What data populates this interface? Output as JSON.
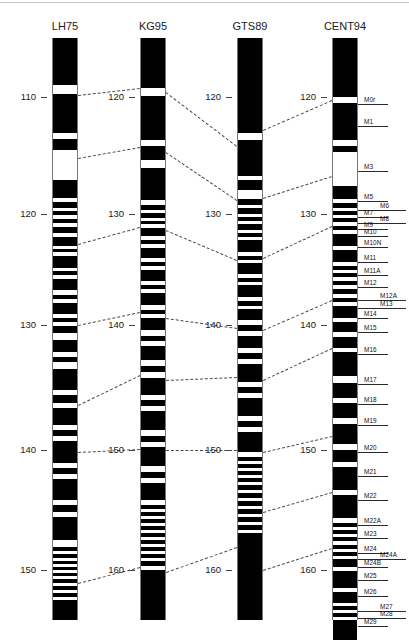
{
  "figure": {
    "type": "chromosome-ideogram-comparison",
    "columns": [
      {
        "id": "LH75",
        "title": "LH75",
        "x": 52,
        "width": 26,
        "top": 38,
        "bottom": 620,
        "axis": {
          "ticks": [
            110,
            120,
            130,
            140,
            150
          ],
          "tick_y": [
            97,
            214,
            325,
            450,
            570
          ]
        }
      },
      {
        "id": "KG95",
        "title": "KG95",
        "x": 140,
        "width": 26,
        "top": 38,
        "bottom": 620,
        "axis": {
          "ticks": [
            120,
            130,
            140,
            150,
            160
          ],
          "tick_y": [
            97,
            214,
            325,
            450,
            570
          ]
        }
      },
      {
        "id": "GTS89",
        "title": "GTS89",
        "x": 237,
        "width": 26,
        "top": 38,
        "bottom": 620,
        "axis": {
          "ticks": [
            120,
            130,
            140,
            150,
            160
          ],
          "tick_y": [
            97,
            214,
            325,
            450,
            570
          ]
        }
      },
      {
        "id": "CENT94",
        "title": "CENT94",
        "x": 332,
        "width": 26,
        "top": 38,
        "bottom": 620,
        "axis": {
          "ticks": [
            120,
            130,
            140,
            150,
            160
          ],
          "tick_y": [
            97,
            214,
            325,
            450,
            570
          ]
        }
      }
    ],
    "markers": [
      {
        "label": "M0r",
        "y": 100,
        "offset": false
      },
      {
        "label": "M1",
        "y": 122,
        "offset": false
      },
      {
        "label": "M3",
        "y": 167,
        "offset": false
      },
      {
        "label": "M5",
        "y": 197,
        "offset": false
      },
      {
        "label": "M6",
        "y": 206,
        "offset": true
      },
      {
        "label": "M7",
        "y": 213,
        "offset": false
      },
      {
        "label": "M8",
        "y": 219,
        "offset": true
      },
      {
        "label": "M9",
        "y": 225,
        "offset": false
      },
      {
        "label": "M10",
        "y": 232,
        "offset": false
      },
      {
        "label": "M10N",
        "y": 243,
        "offset": false
      },
      {
        "label": "M11",
        "y": 258,
        "offset": false
      },
      {
        "label": "M11A",
        "y": 271,
        "offset": false
      },
      {
        "label": "M12",
        "y": 283,
        "offset": false
      },
      {
        "label": "M12A",
        "y": 296,
        "offset": true
      },
      {
        "label": "M13",
        "y": 304,
        "offset": true
      },
      {
        "label": "M14",
        "y": 314,
        "offset": false
      },
      {
        "label": "M15",
        "y": 328,
        "offset": false
      },
      {
        "label": "M16",
        "y": 350,
        "offset": false
      },
      {
        "label": "M17",
        "y": 380,
        "offset": false
      },
      {
        "label": "M18",
        "y": 400,
        "offset": false
      },
      {
        "label": "M19",
        "y": 421,
        "offset": false
      },
      {
        "label": "M20",
        "y": 448,
        "offset": false
      },
      {
        "label": "M21",
        "y": 472,
        "offset": false
      },
      {
        "label": "M22",
        "y": 496,
        "offset": false
      },
      {
        "label": "M22A",
        "y": 521,
        "offset": false
      },
      {
        "label": "M23",
        "y": 534,
        "offset": false
      },
      {
        "label": "M24",
        "y": 549,
        "offset": false
      },
      {
        "label": "M24A",
        "y": 555,
        "offset": true
      },
      {
        "label": "M24B",
        "y": 563,
        "offset": false
      },
      {
        "label": "M25",
        "y": 576,
        "offset": false
      },
      {
        "label": "M26",
        "y": 592,
        "offset": false
      },
      {
        "label": "M27",
        "y": 607,
        "offset": true
      },
      {
        "label": "M28",
        "y": 614,
        "offset": true
      },
      {
        "label": "M29",
        "y": 622,
        "offset": false
      }
    ],
    "bands": {
      "LH75": [
        [
          38,
          85
        ],
        [
          94,
          133
        ],
        [
          139,
          150
        ],
        [
          180,
          198
        ],
        [
          202,
          208
        ],
        [
          211,
          215
        ],
        [
          219,
          223
        ],
        [
          227,
          233
        ],
        [
          237,
          246
        ],
        [
          249,
          252
        ],
        [
          256,
          268
        ],
        [
          271,
          275
        ],
        [
          279,
          290
        ],
        [
          295,
          299
        ],
        [
          303,
          314
        ],
        [
          318,
          322
        ],
        [
          326,
          333
        ],
        [
          340,
          352
        ],
        [
          357,
          362
        ],
        [
          369,
          390
        ],
        [
          395,
          403
        ],
        [
          408,
          425
        ],
        [
          430,
          436
        ],
        [
          441,
          463
        ],
        [
          468,
          474
        ],
        [
          479,
          500
        ],
        [
          505,
          512
        ],
        [
          517,
          540
        ],
        [
          547,
          551
        ],
        [
          554,
          558
        ],
        [
          561,
          564
        ],
        [
          567,
          570
        ],
        [
          573,
          576
        ],
        [
          579,
          583
        ],
        [
          586,
          590
        ],
        [
          593,
          597
        ],
        [
          600,
          620
        ]
      ],
      "KG95": [
        [
          38,
          88
        ],
        [
          96,
          140
        ],
        [
          146,
          160
        ],
        [
          168,
          200
        ],
        [
          205,
          210
        ],
        [
          213,
          218
        ],
        [
          221,
          224
        ],
        [
          228,
          236
        ],
        [
          240,
          244
        ],
        [
          248,
          258
        ],
        [
          262,
          266
        ],
        [
          270,
          281
        ],
        [
          285,
          289
        ],
        [
          293,
          305
        ],
        [
          310,
          314
        ],
        [
          318,
          330
        ],
        [
          336,
          341
        ],
        [
          346,
          360
        ],
        [
          366,
          372
        ],
        [
          378,
          395
        ],
        [
          400,
          406
        ],
        [
          411,
          430
        ],
        [
          436,
          442
        ],
        [
          447,
          466
        ],
        [
          472,
          478
        ],
        [
          483,
          500
        ],
        [
          505,
          509
        ],
        [
          512,
          516
        ],
        [
          519,
          523
        ],
        [
          526,
          530
        ],
        [
          533,
          537
        ],
        [
          540,
          544
        ],
        [
          547,
          551
        ],
        [
          554,
          558
        ],
        [
          561,
          566
        ],
        [
          570,
          620
        ]
      ],
      "GTS89": [
        [
          38,
          133
        ],
        [
          140,
          176
        ],
        [
          180,
          190
        ],
        [
          199,
          205
        ],
        [
          208,
          214
        ],
        [
          217,
          221
        ],
        [
          224,
          230
        ],
        [
          233,
          237
        ],
        [
          240,
          252
        ],
        [
          256,
          260
        ],
        [
          263,
          274
        ],
        [
          278,
          282
        ],
        [
          285,
          297
        ],
        [
          301,
          306
        ],
        [
          309,
          320
        ],
        [
          325,
          331
        ],
        [
          336,
          348
        ],
        [
          353,
          359
        ],
        [
          364,
          382
        ],
        [
          387,
          393
        ],
        [
          398,
          416
        ],
        [
          421,
          427
        ],
        [
          432,
          452
        ],
        [
          457,
          461
        ],
        [
          464,
          468
        ],
        [
          471,
          475
        ],
        [
          478,
          482
        ],
        [
          485,
          490
        ],
        [
          493,
          498
        ],
        [
          501,
          506
        ],
        [
          509,
          514
        ],
        [
          517,
          522
        ],
        [
          525,
          530
        ],
        [
          533,
          620
        ]
      ],
      "CENT94": [
        [
          38,
          97
        ],
        [
          103,
          140
        ],
        [
          146,
          152
        ],
        [
          186,
          199
        ],
        [
          203,
          208
        ],
        [
          211,
          215
        ],
        [
          218,
          222
        ],
        [
          226,
          230
        ],
        [
          234,
          246
        ],
        [
          250,
          262
        ],
        [
          266,
          270
        ],
        [
          273,
          277
        ],
        [
          281,
          285
        ],
        [
          289,
          294
        ],
        [
          298,
          302
        ],
        [
          306,
          318
        ],
        [
          322,
          332
        ],
        [
          337,
          348
        ],
        [
          352,
          376
        ],
        [
          383,
          398
        ],
        [
          403,
          418
        ],
        [
          424,
          444
        ],
        [
          450,
          462
        ],
        [
          467,
          490
        ],
        [
          495,
          518
        ],
        [
          523,
          527
        ],
        [
          530,
          534
        ],
        [
          537,
          541
        ],
        [
          545,
          549
        ],
        [
          552,
          556
        ],
        [
          559,
          567
        ],
        [
          571,
          588
        ],
        [
          592,
          603
        ],
        [
          606,
          610
        ],
        [
          613,
          617
        ],
        [
          620,
          640
        ]
      ]
    },
    "links": [
      {
        "x1": 78,
        "y1": 95,
        "x2": 140,
        "y2": 88
      },
      {
        "x1": 78,
        "y1": 158,
        "x2": 140,
        "y2": 147
      },
      {
        "x1": 78,
        "y1": 244,
        "x2": 140,
        "y2": 227
      },
      {
        "x1": 78,
        "y1": 325,
        "x2": 140,
        "y2": 312
      },
      {
        "x1": 78,
        "y1": 405,
        "x2": 140,
        "y2": 375
      },
      {
        "x1": 78,
        "y1": 452,
        "x2": 140,
        "y2": 449
      },
      {
        "x1": 78,
        "y1": 583,
        "x2": 140,
        "y2": 567
      },
      {
        "x1": 166,
        "y1": 92,
        "x2": 237,
        "y2": 146
      },
      {
        "x1": 166,
        "y1": 152,
        "x2": 237,
        "y2": 200
      },
      {
        "x1": 166,
        "y1": 230,
        "x2": 237,
        "y2": 260
      },
      {
        "x1": 166,
        "y1": 318,
        "x2": 237,
        "y2": 328
      },
      {
        "x1": 166,
        "y1": 380,
        "x2": 237,
        "y2": 377
      },
      {
        "x1": 166,
        "y1": 450,
        "x2": 237,
        "y2": 450
      },
      {
        "x1": 166,
        "y1": 572,
        "x2": 237,
        "y2": 547
      },
      {
        "x1": 263,
        "y1": 130,
        "x2": 332,
        "y2": 100
      },
      {
        "x1": 263,
        "y1": 198,
        "x2": 332,
        "y2": 176
      },
      {
        "x1": 263,
        "y1": 258,
        "x2": 332,
        "y2": 226
      },
      {
        "x1": 263,
        "y1": 330,
        "x2": 332,
        "y2": 300
      },
      {
        "x1": 263,
        "y1": 380,
        "x2": 332,
        "y2": 348
      },
      {
        "x1": 263,
        "y1": 452,
        "x2": 332,
        "y2": 436
      },
      {
        "x1": 263,
        "y1": 512,
        "x2": 332,
        "y2": 492
      },
      {
        "x1": 263,
        "y1": 570,
        "x2": 332,
        "y2": 548
      }
    ]
  }
}
